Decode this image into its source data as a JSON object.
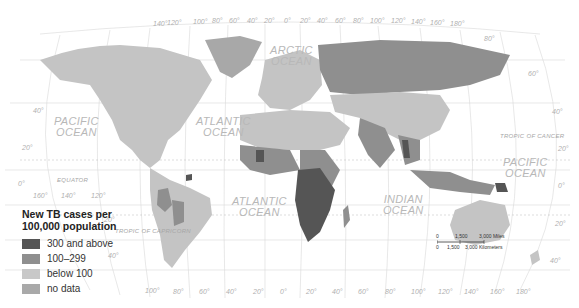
{
  "legend": {
    "title_line1": "New TB cases per",
    "title_line2": "100,000 population",
    "items": [
      {
        "label": "300 and above",
        "color": "#555555"
      },
      {
        "label": "100–299",
        "color": "#8f8f8f"
      },
      {
        "label": "below 100",
        "color": "#c8c8c8"
      },
      {
        "label": "no data",
        "color": "#a9a9a9"
      }
    ]
  },
  "oceans": {
    "arctic": [
      "ARCTIC",
      "OCEAN"
    ],
    "pacific_west": [
      "PACIFIC",
      "OCEAN"
    ],
    "atlantic_north": [
      "ATLANTIC",
      "OCEAN"
    ],
    "atlantic_south": [
      "ATLANTIC",
      "OCEAN"
    ],
    "indian": [
      "INDIAN",
      "OCEAN"
    ],
    "pacific_east": [
      "PACIFIC",
      "OCEAN"
    ]
  },
  "lines": {
    "equator": "EQUATOR",
    "tropic_cancer": "TROPIC OF CANCER",
    "tropic_capricorn": "TROPIC OF CAPRICORN"
  },
  "top_longitudes": [
    "140°",
    "120°",
    "100°",
    "80°",
    "60°",
    "40°",
    "20°",
    "0°",
    "20°",
    "40°",
    "60°",
    "80°",
    "100°",
    "120°",
    "140°",
    "160°",
    "180°"
  ],
  "bottom_longitudes": [
    "100°",
    "80°",
    "60°",
    "40°",
    "20°",
    "0°",
    "20°",
    "40°",
    "60°",
    "80°",
    "100°",
    "120°",
    "140°",
    "160°",
    "180°"
  ],
  "left_lats": {
    "l40": "40°",
    "l20": "20°",
    "l0": "0°",
    "l20s": "20°",
    "l40s": "40°"
  },
  "right_lats": {
    "r80": "80°",
    "r60": "60°",
    "r40": "40°",
    "r20": "20°",
    "r0": "0°",
    "r20s": "20°",
    "r40s": "40°"
  },
  "equator_longs": [
    "160°",
    "140°",
    "120°"
  ],
  "scale": {
    "miles_ticks": [
      "0",
      "1,500",
      "3,000 Miles"
    ],
    "km_ticks": [
      "0",
      "1,500",
      "3,000 Kilometers"
    ]
  }
}
